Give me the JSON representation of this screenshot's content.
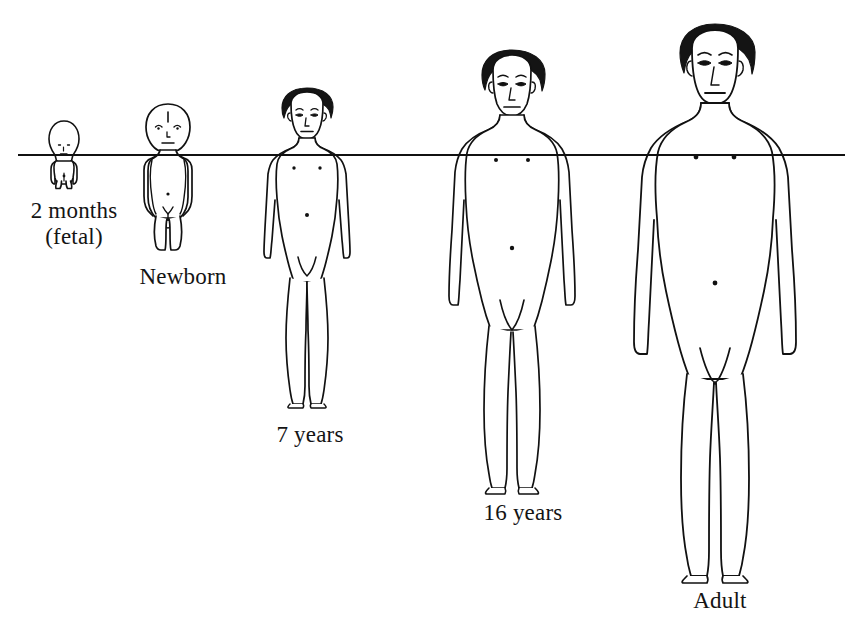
{
  "illustration": {
    "title": "Human body proportion changes during growth",
    "background_color": "#ffffff",
    "line_color": "#111111",
    "hair_color": "#141414",
    "reference_line": {
      "label": "chest-level horizontal reference line",
      "y": 155,
      "x_start": 18,
      "x_end": 845
    },
    "top_clipped_text": ""
  },
  "stages": [
    {
      "id": "fetal",
      "label_line1": "2 months",
      "label_line2": "(fetal)",
      "center_x": 64,
      "head_top_y": 122,
      "feet_y": 188,
      "total_height_px": 66,
      "head_height_px": 30,
      "head_fraction_of_body": 0.45,
      "heads_tall": 2.2
    },
    {
      "id": "newborn",
      "label_line1": "Newborn",
      "label_line2": "",
      "center_x": 168,
      "head_top_y": 104,
      "feet_y": 250,
      "total_height_px": 146,
      "head_height_px": 47,
      "head_fraction_of_body": 0.32,
      "heads_tall": 3.1
    },
    {
      "id": "seven-years",
      "label_line1": "7 years",
      "label_line2": "",
      "center_x": 307,
      "head_top_y": 88,
      "feet_y": 408,
      "total_height_px": 320,
      "head_height_px": 58,
      "head_fraction_of_body": 0.18,
      "heads_tall": 5.5
    },
    {
      "id": "sixteen-years",
      "label_line1": "16 years",
      "label_line2": "",
      "center_x": 512,
      "head_top_y": 50,
      "feet_y": 490,
      "total_height_px": 440,
      "head_height_px": 66,
      "head_fraction_of_body": 0.15,
      "heads_tall": 6.7
    },
    {
      "id": "adult",
      "label_line1": "Adult",
      "label_line2": "",
      "center_x": 715,
      "head_top_y": 24,
      "feet_y": 582,
      "total_height_px": 558,
      "head_height_px": 76,
      "head_fraction_of_body": 0.136,
      "heads_tall": 7.4
    }
  ]
}
